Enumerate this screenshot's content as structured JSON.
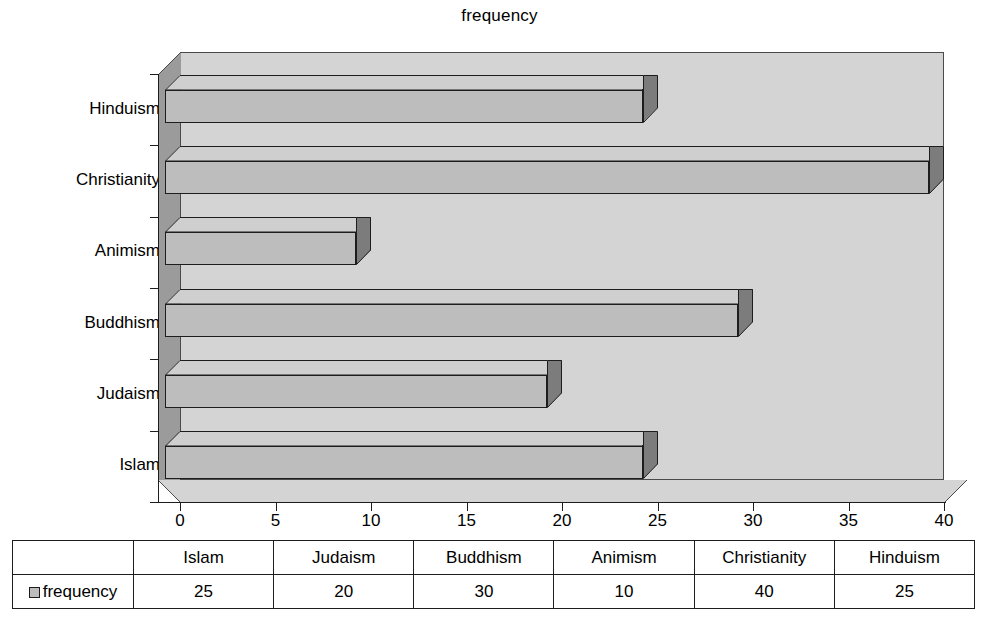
{
  "chart_data": {
    "type": "bar",
    "orientation": "horizontal",
    "title": "frequency",
    "xlabel": "",
    "ylabel": "",
    "categories": [
      "Islam",
      "Judaism",
      "Buddhism",
      "Animism",
      "Christianity",
      "Hinduism"
    ],
    "values": [
      25,
      20,
      30,
      10,
      40,
      25
    ],
    "series": [
      {
        "name": "frequency",
        "values": [
          25,
          20,
          30,
          10,
          40,
          25
        ]
      }
    ],
    "xlim": [
      0,
      40
    ],
    "xticks": [
      0,
      5,
      10,
      15,
      20,
      25,
      30,
      35,
      40
    ],
    "xtick_labels": [
      "0",
      "5",
      "10",
      "15",
      "20",
      "25",
      "30",
      "35",
      "40"
    ],
    "ytick_labels_top_to_bottom": [
      "Hinduism",
      "Christianity",
      "Animism",
      "Buddhism",
      "Judaism",
      "Islam"
    ],
    "grid": false,
    "legend": [
      "frequency"
    ],
    "legend_position": "data-table-row-header",
    "style_3d": true
  },
  "title": {
    "text": "frequency"
  },
  "axis": {
    "x_ticks": [
      {
        "value": 0,
        "label": "0"
      },
      {
        "value": 5,
        "label": "5"
      },
      {
        "value": 10,
        "label": "10"
      },
      {
        "value": 15,
        "label": "15"
      },
      {
        "value": 20,
        "label": "20"
      },
      {
        "value": 25,
        "label": "25"
      },
      {
        "value": 30,
        "label": "30"
      },
      {
        "value": 35,
        "label": "35"
      },
      {
        "value": 40,
        "label": "40"
      }
    ],
    "y_categories_top_to_bottom": [
      {
        "label": "Hinduism"
      },
      {
        "label": "Christianity"
      },
      {
        "label": "Animism"
      },
      {
        "label": "Buddhism"
      },
      {
        "label": "Judaism"
      },
      {
        "label": "Islam"
      }
    ]
  },
  "bars_top_to_bottom": [
    {
      "label": "Hinduism",
      "value": 25
    },
    {
      "label": "Christianity",
      "value": 40
    },
    {
      "label": "Animism",
      "value": 10
    },
    {
      "label": "Buddhism",
      "value": 30
    },
    {
      "label": "Judaism",
      "value": 20
    },
    {
      "label": "Islam",
      "value": 25
    }
  ],
  "table": {
    "row_header_label": "frequency",
    "columns": [
      "Islam",
      "Judaism",
      "Buddhism",
      "Animism",
      "Christianity",
      "Hinduism"
    ],
    "values": [
      "25",
      "20",
      "30",
      "10",
      "40",
      "25"
    ]
  },
  "colors": {
    "bar_front": "#bdbdbd",
    "bar_top": "#cfcfcf",
    "bar_cap": "#7c7c7c",
    "plot_background": "#d4d4d4",
    "left_wall": "#9b9b9b",
    "outline": "#1d1d1d",
    "page_background": "#ffffff"
  }
}
